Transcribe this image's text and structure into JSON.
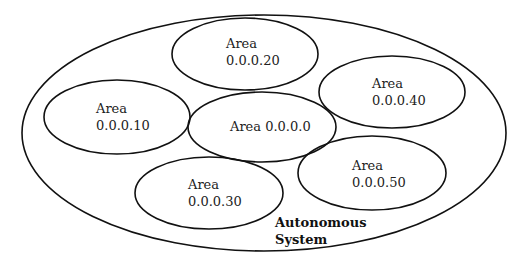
{
  "diagram": {
    "stroke_color": "#111111",
    "background": "#ffffff",
    "container": {
      "label_line1": "Autonomous",
      "label_line2": "System"
    },
    "areas": [
      {
        "id": "area-20",
        "line1": "Area",
        "line2": "0.0.0.20"
      },
      {
        "id": "area-10",
        "line1": "Area",
        "line2": "0.0.0.10"
      },
      {
        "id": "area-0",
        "line1": "Area 0.0.0.0",
        "line2": ""
      },
      {
        "id": "area-40",
        "line1": "Area",
        "line2": "0.0.0.40"
      },
      {
        "id": "area-30",
        "line1": "Area",
        "line2": "0.0.0.30"
      },
      {
        "id": "area-50",
        "line1": "Area",
        "line2": "0.0.0.50"
      }
    ]
  }
}
